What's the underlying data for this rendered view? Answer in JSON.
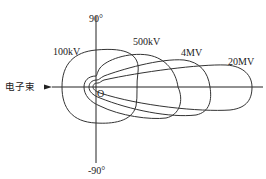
{
  "diagram": {
    "axis_top_label": "90°",
    "axis_bottom_label": "-90°",
    "origin_label": "O",
    "beam_label": "电子束",
    "curves": [
      {
        "label": "100kV"
      },
      {
        "label": "500kV"
      },
      {
        "label": "4MV"
      },
      {
        "label": "20MV"
      }
    ],
    "colors": {
      "line": "#333333",
      "background": "#ffffff"
    }
  }
}
